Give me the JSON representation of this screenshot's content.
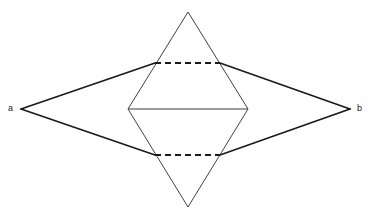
{
  "figure": {
    "type": "geometric-diagram",
    "canvas": {
      "width": 372,
      "height": 219
    },
    "background_color": "#ffffff",
    "stroke_color": "#1a1a1a",
    "labels": [
      {
        "id": "a",
        "text": "a",
        "x": 10,
        "y": 109,
        "anchor": "left-vertex"
      },
      {
        "id": "b",
        "text": "b",
        "x": 359,
        "y": 109,
        "anchor": "right-vertex"
      }
    ],
    "points": {
      "a": {
        "x": 21,
        "y": 109
      },
      "b": {
        "x": 350,
        "y": 109
      },
      "top_apex": {
        "x": 188,
        "y": 12
      },
      "bottom_apex": {
        "x": 188,
        "y": 207
      },
      "hex_left": {
        "x": 128,
        "y": 109
      },
      "hex_right": {
        "x": 248,
        "y": 109
      },
      "upper_left_cross": {
        "x": 155,
        "y": 63
      },
      "upper_right_cross": {
        "x": 220,
        "y": 63
      },
      "lower_left_cross": {
        "x": 155,
        "y": 155
      },
      "lower_right_cross": {
        "x": 220,
        "y": 155
      }
    },
    "shapes": [
      {
        "name": "rhombus-upper-left-edge",
        "style": "solid",
        "weight": 1.7,
        "from": [
          21,
          109
        ],
        "to": [
          155,
          63
        ]
      },
      {
        "name": "rhombus-upper-right-edge",
        "style": "solid",
        "weight": 1.7,
        "from": [
          220,
          63
        ],
        "to": [
          350,
          109
        ]
      },
      {
        "name": "rhombus-lower-left-edge",
        "style": "solid",
        "weight": 1.7,
        "from": [
          21,
          109
        ],
        "to": [
          155,
          155
        ]
      },
      {
        "name": "rhombus-lower-right-edge",
        "style": "solid",
        "weight": 1.7,
        "from": [
          220,
          155
        ],
        "to": [
          350,
          109
        ]
      },
      {
        "name": "rhombus-top-hidden-edge",
        "style": "dashed",
        "weight": 1.9,
        "from": [
          155,
          63
        ],
        "to": [
          220,
          63
        ]
      },
      {
        "name": "rhombus-bottom-hidden-edge",
        "style": "dashed",
        "weight": 1.9,
        "from": [
          155,
          155
        ],
        "to": [
          220,
          155
        ]
      },
      {
        "name": "upper-triangle-left-edge",
        "style": "solid",
        "weight": 0.9,
        "from": [
          188,
          12
        ],
        "to": [
          128,
          109
        ]
      },
      {
        "name": "upper-triangle-right-edge",
        "style": "solid",
        "weight": 0.9,
        "from": [
          188,
          12
        ],
        "to": [
          248,
          109
        ]
      },
      {
        "name": "lower-triangle-left-edge",
        "style": "solid",
        "weight": 0.9,
        "from": [
          188,
          207
        ],
        "to": [
          128,
          109
        ]
      },
      {
        "name": "lower-triangle-right-edge",
        "style": "solid",
        "weight": 0.9,
        "from": [
          188,
          207
        ],
        "to": [
          248,
          109
        ]
      },
      {
        "name": "shared-horizontal-base",
        "style": "solid",
        "weight": 1.1,
        "from": [
          128,
          109
        ],
        "to": [
          248,
          109
        ]
      }
    ],
    "dash_pattern": "6 4"
  }
}
